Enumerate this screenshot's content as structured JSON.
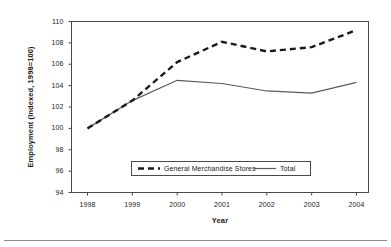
{
  "chart_data": {
    "type": "line",
    "title": "",
    "xlabel": "Year",
    "ylabel": "Employment (Indexed, 1998=100)",
    "categories": [
      "1998",
      "1999",
      "2000",
      "2001",
      "2002",
      "2003",
      "2004"
    ],
    "x": [
      1998,
      1999,
      2000,
      2001,
      2002,
      2003,
      2004
    ],
    "xlim": [
      1998,
      2004
    ],
    "ylim": [
      94,
      110
    ],
    "yticks": [
      110,
      108,
      106,
      104,
      102,
      100,
      98,
      96,
      94
    ],
    "ytick_labels": [
      "110",
      "108",
      "106",
      "104",
      "102",
      "100",
      "98",
      "96",
      "94"
    ],
    "grid": false,
    "legend_position": "inside-bottom-center",
    "series": [
      {
        "name": "General Merchandise Stores",
        "style": "dashed",
        "color": "#1a1a1a",
        "values": [
          100.0,
          102.6,
          106.2,
          108.1,
          107.2,
          107.6,
          109.2
        ]
      },
      {
        "name": "Total",
        "style": "solid",
        "color": "#5a5a5a",
        "values": [
          100.0,
          102.6,
          104.5,
          104.2,
          103.5,
          103.3,
          104.3
        ]
      }
    ]
  },
  "axes": {
    "y_title": "Employment (Indexed, 1998=100)",
    "x_title": "Year"
  },
  "legend": {
    "items": [
      {
        "label": "General Merchandise Stores",
        "style": "dashed"
      },
      {
        "label": "Total",
        "style": "solid"
      }
    ]
  },
  "colors": {
    "series_dashed": "#1a1a1a",
    "series_solid": "#5a5a5a",
    "axis": "#4a4a4a",
    "text": "#1a1a1a",
    "footer_rule": "#8a8a8a",
    "background": "#ffffff"
  }
}
